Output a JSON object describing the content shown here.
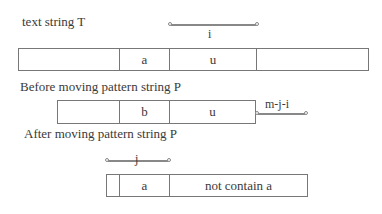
{
  "labels": {
    "text_string": "text string T",
    "before": "Before moving pattern string P",
    "after": "After moving pattern string P"
  },
  "arrows": {
    "i": "i",
    "mji": "m-j-i",
    "j": "j"
  },
  "text_row": {
    "cells": [
      "",
      "a",
      "u",
      ""
    ]
  },
  "before_row": {
    "cells": [
      "",
      "b",
      "u"
    ]
  },
  "after_row": {
    "cells": [
      "",
      "a",
      "not contain a"
    ]
  },
  "colors": {
    "line": "#777777",
    "text": "#3a3a3a"
  }
}
